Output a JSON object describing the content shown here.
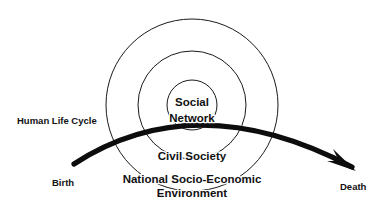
{
  "diagram": {
    "colors": {
      "background": "#ffffff",
      "ring_stroke": "#1a1a1a",
      "arrow_stroke": "#0d0d0d",
      "text": "#111111"
    },
    "rings": [
      {
        "id": "outer-ring",
        "label_line_1": "National Socio-Economic",
        "label_line_2": "Environment",
        "cx": 192,
        "cy": 105,
        "r": 86
      },
      {
        "id": "middle-ring",
        "label_line_1": "Civil Society",
        "label_line_2": "",
        "cx": 192,
        "cy": 105,
        "r": 54
      },
      {
        "id": "inner-ring",
        "label_line_1": "Social",
        "label_line_2": "Network",
        "cx": 192,
        "cy": 105,
        "r": 25
      }
    ],
    "arc": {
      "name": "Human Life Cycle",
      "start_label": "Birth",
      "end_label": "Death",
      "path": "M 74 164 Q 196 85 352 167",
      "arrow_tip_x": 356,
      "arrow_tip_y": 170
    },
    "labels": {
      "human_life_cycle": "Human Life Cycle",
      "birth": "Birth",
      "death": "Death",
      "social": "Social",
      "network": "Network",
      "civil_society": "Civil Society",
      "national_line_1": "National Socio-Economic",
      "national_line_2": "Environment"
    }
  }
}
